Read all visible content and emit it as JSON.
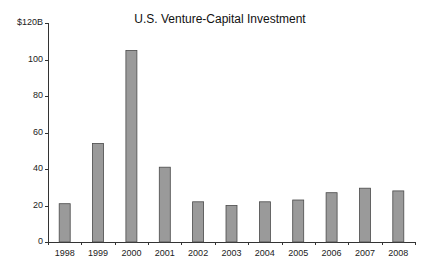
{
  "chart_data": {
    "type": "bar",
    "title": "U.S. Venture-Capital Investment",
    "xlabel": "",
    "ylabel": "",
    "categories": [
      "1998",
      "1999",
      "2000",
      "2001",
      "2002",
      "2003",
      "2004",
      "2005",
      "2006",
      "2007",
      "2008"
    ],
    "values": [
      21,
      54,
      105,
      41,
      22,
      20,
      22,
      23,
      27,
      29.5,
      28
    ],
    "ylim": [
      0,
      120
    ],
    "yticks": [
      0,
      20,
      40,
      60,
      80,
      100,
      120
    ],
    "ytick_labels": [
      "0",
      "20",
      "40",
      "60",
      "80",
      "100",
      "$120B"
    ],
    "grid": false,
    "legend": null,
    "colors": {
      "bar_fill": "#9a9a9a",
      "bar_stroke": "#4a4a4a",
      "axis": "#333333"
    }
  }
}
